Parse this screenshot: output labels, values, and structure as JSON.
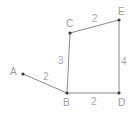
{
  "diagram": {
    "type": "weighted-graph",
    "vertices": [
      {
        "id": "A",
        "label": "A",
        "x": 23,
        "y": 74,
        "lx": 10,
        "ly": 75
      },
      {
        "id": "B",
        "label": "B",
        "x": 67,
        "y": 93,
        "lx": 63,
        "ly": 106
      },
      {
        "id": "C",
        "label": "C",
        "x": 70,
        "y": 33,
        "lx": 66,
        "ly": 27
      },
      {
        "id": "D",
        "label": "D",
        "x": 119,
        "y": 93,
        "lx": 118,
        "ly": 106
      },
      {
        "id": "E",
        "label": "E",
        "x": 119,
        "y": 20,
        "lx": 118,
        "ly": 15
      }
    ],
    "edges": [
      {
        "from": "A",
        "to": "B",
        "weight": "2",
        "lx": 43,
        "ly": 80
      },
      {
        "from": "B",
        "to": "C",
        "weight": "3",
        "lx": 58,
        "ly": 64
      },
      {
        "from": "C",
        "to": "E",
        "weight": "2",
        "lx": 92,
        "ly": 22
      },
      {
        "from": "E",
        "to": "D",
        "weight": "4",
        "lx": 121,
        "ly": 65
      },
      {
        "from": "B",
        "to": "D",
        "weight": "2",
        "lx": 91,
        "ly": 105
      }
    ]
  },
  "labels": {
    "A": "A",
    "B": "B",
    "C": "C",
    "D": "D",
    "E": "E",
    "AB": "2",
    "BC": "3",
    "CE": "2",
    "ED": "4",
    "BD": "2"
  }
}
